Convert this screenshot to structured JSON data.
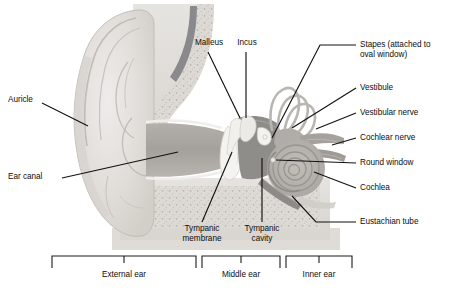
{
  "figure": {
    "type": "anatomical-diagram",
    "background_color": "#ffffff",
    "line_color": "#111111",
    "text_color": "#0d0d0d"
  },
  "labels": {
    "auricle": "Auricle",
    "ear_canal": "Ear canal",
    "malleus": "Malleus",
    "incus": "Incus",
    "stapes_line1": "Stapes (attached to",
    "stapes_line2": "oval window)",
    "vestibule": "Vestibule",
    "vestibular_nerve": "Vestibular nerve",
    "cochlear_nerve": "Cochlear nerve",
    "round_window": "Round window",
    "cochlea": "Cochlea",
    "eustachian_tube": "Eustachian tube",
    "tympanic_membrane_line1": "Tympanic",
    "tympanic_membrane_line2": "membrane",
    "tympanic_cavity_line1": "Tympanic",
    "tympanic_cavity_line2": "cavity"
  },
  "sections": {
    "external_ear": "External ear",
    "middle_ear": "Middle ear",
    "inner_ear": "Inner ear"
  },
  "palette": {
    "skin_light": "#e2e0dc",
    "skin_mid": "#d2cfca",
    "cartilage": "#d8d6d1",
    "bone_speckle": "#cdcac4",
    "canal_dark": "#a9a6a2",
    "cavity_dark": "#8f8d8a",
    "ossicle_white": "#f2f1ee",
    "cochlea_gray": "#b6b3ae",
    "nerve_gray": "#a3a09b",
    "dark_band": "#8a8a8c",
    "outline": "#b5b2ad"
  }
}
